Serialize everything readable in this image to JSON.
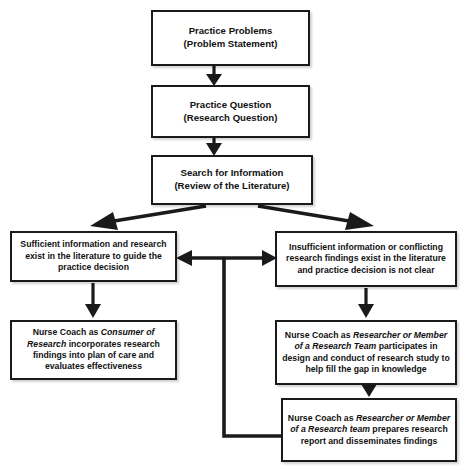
{
  "diagram": {
    "background_color": "#ffffff",
    "line_color": "#1a1a1a",
    "text_color": "#111111",
    "nodes": {
      "practice_problems": "Practice Problems\n(Problem Statement)",
      "practice_question": "Practice Question\n(Research Question)",
      "search_information": "Search for Information\n(Review of the Literature)",
      "sufficient_info": "Sufficient information and research exist in the literature to guide the practice decision",
      "insufficient_info": "Insufficient information or conflicting research findings exist in the literature and practice decision is not clear",
      "consumer_research_plain_1": "Nurse Coach as ",
      "consumer_research_italic": "Consumer of Research",
      "consumer_research_plain_2": " incorporates research findings into plan of care and evaluates effectiveness",
      "researcher_member_plain_1": "Nurse Coach as ",
      "researcher_member_italic": "Researcher or Member of a Research Team",
      "researcher_member_plain_2": " participates in design and conduct of research study to help fill the gap in knowledge",
      "prepares_report_plain_1": "Nurse Coach as ",
      "prepares_report_italic": "Researcher or Member of a Research team",
      "prepares_report_plain_2": " prepares research report and disseminates findings"
    },
    "edges": [
      {
        "name": "practice-problems-to-practice-question",
        "type": "arrow-down"
      },
      {
        "name": "practice-question-to-search-information",
        "type": "arrow-down"
      },
      {
        "name": "search-information-to-sufficient-info",
        "type": "arrow-diagonal-left"
      },
      {
        "name": "search-information-to-insufficient-info",
        "type": "arrow-diagonal-right"
      },
      {
        "name": "sufficient-insufficient-bidirectional",
        "type": "arrow-double-horizontal"
      },
      {
        "name": "sufficient-info-to-consumer-research",
        "type": "arrow-down"
      },
      {
        "name": "insufficient-info-to-researcher-member",
        "type": "arrow-down"
      },
      {
        "name": "researcher-member-to-prepares-report",
        "type": "arrow-down"
      },
      {
        "name": "prepares-report-feedback-loop",
        "type": "elbow-line"
      }
    ]
  }
}
